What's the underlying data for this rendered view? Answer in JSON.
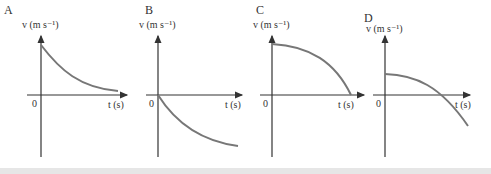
{
  "graphs": [
    {
      "letter": "A",
      "y_label": "v (m s⁻¹)",
      "origin": "0",
      "x_label": "t (s)",
      "shape": "starts positive at t=0, decreasing exponentially toward zero"
    },
    {
      "letter": "B",
      "y_label": "v (m s⁻¹)",
      "origin": "0",
      "x_label": "t (s)",
      "shape": "starts at zero, becomes increasingly negative, leveling off"
    },
    {
      "letter": "C",
      "y_label": "v (m s⁻¹)",
      "origin": "0",
      "x_label": "t (s)",
      "shape": "starts positive, decreasing ever faster to zero"
    },
    {
      "letter": "D",
      "y_label": "v (m s⁻¹)",
      "origin": "0",
      "x_label": "t (s)",
      "shape": "starts positive, decreasing through zero to negative"
    }
  ],
  "colors": {
    "axis": "#333333",
    "curve": "#777777"
  }
}
